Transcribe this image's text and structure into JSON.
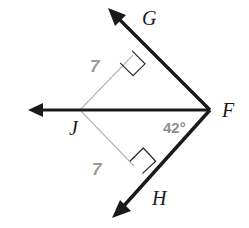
{
  "figure": {
    "kind": "kite-geometry-diagram",
    "background_color": "#ffffff",
    "stroke_color": "#1a1a1a",
    "thin_stroke_color": "#b5b5b5",
    "label_color": "#1a1a1a",
    "measure_color": "#9a9a9a",
    "width": 249,
    "height": 228
  },
  "labels": {
    "vertex_g": "G",
    "vertex_f": "F",
    "vertex_j": "J",
    "vertex_h": "H",
    "segment_jg_length": "7",
    "segment_jh_length": "7",
    "angle_at_f": "42°"
  },
  "geometry": {
    "points": {
      "J": {
        "x": 80,
        "y": 110
      },
      "F": {
        "x": 210,
        "y": 110
      },
      "G_on_ray": {
        "x": 139,
        "y": 32
      },
      "H_on_ray": {
        "x": 142,
        "y": 188
      },
      "ray_fg_tip": {
        "x": 108,
        "y": 8
      },
      "ray_fh_tip": {
        "x": 112,
        "y": 218
      },
      "ray_j_left_tip": {
        "x": 28,
        "y": 110
      },
      "foot_upper": {
        "x": 133,
        "y": 55
      },
      "foot_lower": {
        "x": 134,
        "y": 166
      }
    },
    "right_angles": [
      {
        "at": "foot_upper",
        "marked": true
      },
      {
        "at": "foot_lower",
        "marked": true
      }
    ],
    "rays": [
      {
        "name": "ray-f-to-g",
        "from": "F",
        "through": "G_on_ray",
        "arrow_at": "ray_fg_tip",
        "weight": "thick"
      },
      {
        "name": "ray-f-to-h",
        "from": "F",
        "through": "H_on_ray",
        "arrow_at": "ray_fh_tip",
        "weight": "thick"
      },
      {
        "name": "ray-f-to-j-left",
        "from": "F",
        "through": "J",
        "arrow_at": "ray_j_left_tip",
        "weight": "thick"
      }
    ],
    "segments": [
      {
        "name": "segment-j-to-upper-foot",
        "from": "J",
        "to": "foot_upper",
        "weight": "thin",
        "label": "7"
      },
      {
        "name": "segment-j-to-lower-foot",
        "from": "J",
        "to": "foot_lower",
        "weight": "thin",
        "label": "7"
      }
    ]
  },
  "label_positions": {
    "G": {
      "x": 142,
      "y": 25
    },
    "F": {
      "x": 222,
      "y": 117
    },
    "J": {
      "x": 69,
      "y": 135
    },
    "H": {
      "x": 152,
      "y": 205
    },
    "seven_upper": {
      "x": 90,
      "y": 72
    },
    "seven_lower": {
      "x": 92,
      "y": 175
    },
    "angle": {
      "x": 163,
      "y": 133
    }
  }
}
